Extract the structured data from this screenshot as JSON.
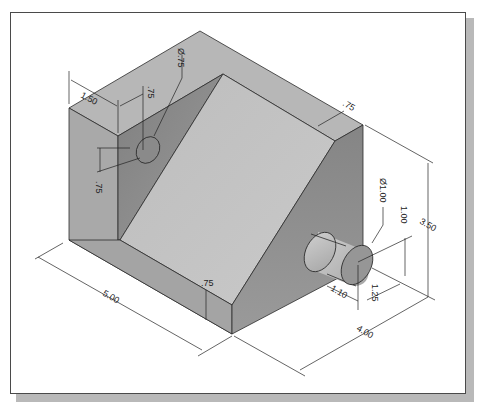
{
  "figure": {
    "type": "isometric-part-drawing",
    "colors": {
      "frame_border": "#4a4a4a",
      "frame_shadow": "#b9b9b9",
      "face_top": "#b5b5b5",
      "face_left": "#a8a8a8",
      "face_inner_wall": "#8c8c8c",
      "face_slope": "#c2c2c2",
      "face_right": "#8e8e8e",
      "face_front_ledge": "#a4a4a4",
      "cylinder_body": "#b8b8b8",
      "cylinder_end": "#969696",
      "hole": "#8a8a8a",
      "dimension_line": "#222222"
    }
  },
  "dimensions": {
    "top_offset": "1.50",
    "hole_offset_horizontal": ".75",
    "hole_diameter": "Ø.75",
    "hole_offset_vertical": ".75",
    "slope_ledge_top": ".75",
    "boss_diameter": "Ø1.00",
    "boss_height_from_base": "1.00",
    "overall_height": "3.50",
    "boss_length": "1.10",
    "boss_offset": "1.25",
    "front_ledge": ".75",
    "length": "5.00",
    "width": "4.00"
  }
}
